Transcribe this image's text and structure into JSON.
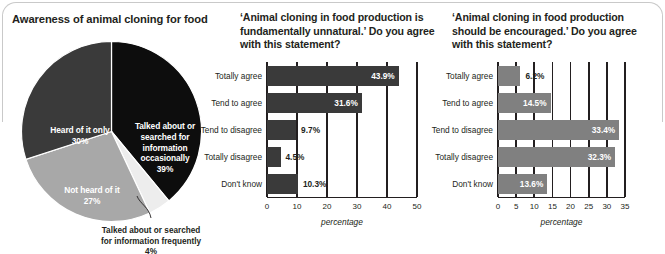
{
  "frame": {
    "accent_dark": "#3a3a3a",
    "accent_mid": "#808080",
    "accent_light": "#a8a8a8",
    "accent_pale": "#e6e6e6",
    "axis_color": "#231f20"
  },
  "panels": {
    "pie": {
      "title": "Awareness of animal cloning for food",
      "callout": "Talked about or searched for information frequently 4%"
    },
    "middle": {
      "title": "‘Animal cloning in food production is fundamentally unnatural.’ Do you agree with this statement?"
    },
    "right": {
      "title": "‘Animal cloning in food production should be encouraged.’ Do you agree with this statement?"
    }
  },
  "chart_data": [
    {
      "type": "pie",
      "title": "Awareness of animal cloning for food",
      "categories": [
        "Talked about or searched for information occasionally",
        "Heard of it only",
        "Not heard of it",
        "Talked about or searched for information frequently"
      ],
      "values": [
        39,
        30,
        27,
        4
      ],
      "value_labels": [
        "39%",
        "30%",
        "27%",
        "4%"
      ],
      "colors": [
        "#0d0d0d",
        "#3a3a3a",
        "#a8a8a8",
        "#ededed"
      ],
      "slice_labels": [
        {
          "name": "Talked about or searched for information occasionally",
          "pct": "39%"
        },
        {
          "name": "Heard of it only",
          "pct": "30%"
        },
        {
          "name": "Not heard of it",
          "pct": "27%"
        },
        {
          "name": "Talked about or searched for information frequently",
          "pct": "4%"
        }
      ],
      "legend": "none",
      "grid": false
    },
    {
      "type": "bar",
      "orientation": "horizontal",
      "title": "‘Animal cloning in food production is fundamentally unnatural.’ Do you agree with this statement?",
      "categories": [
        "Totally agree",
        "Tend to agree",
        "Tend to disagree",
        "Totally disagree",
        "Don't know"
      ],
      "values": [
        43.9,
        31.6,
        9.7,
        4.5,
        10.3
      ],
      "value_labels": [
        "43.9%",
        "31.6%",
        "9.7%",
        "4.5%",
        "10.3%"
      ],
      "xlabel": "percentage",
      "ylabel": "",
      "xlim": [
        0,
        50
      ],
      "xticks": [
        0,
        10,
        20,
        30,
        40,
        50
      ],
      "xtick_labels": [
        "0",
        "10",
        "20",
        "30",
        "40",
        "50"
      ],
      "bar_color": "#3a3a3a",
      "grid": true,
      "legend": "none"
    },
    {
      "type": "bar",
      "orientation": "horizontal",
      "title": "‘Animal cloning in food production should be encouraged.’ Do you agree with this statement?",
      "categories": [
        "Totally agree",
        "Tend to agree",
        "Tend to disagree",
        "Totally disagree",
        "Don't know"
      ],
      "values": [
        6.2,
        14.5,
        33.4,
        32.3,
        13.6
      ],
      "value_labels": [
        "6.2%",
        "14.5%",
        "33.4%",
        "32.3%",
        "13.6%"
      ],
      "xlabel": "percentage",
      "ylabel": "",
      "xlim": [
        0,
        35
      ],
      "xticks": [
        0,
        5,
        10,
        15,
        20,
        25,
        30,
        35
      ],
      "xtick_labels": [
        "0",
        "5",
        "10",
        "15",
        "20",
        "25",
        "30",
        "35"
      ],
      "bar_color": "#808080",
      "grid": true,
      "legend": "none"
    }
  ]
}
